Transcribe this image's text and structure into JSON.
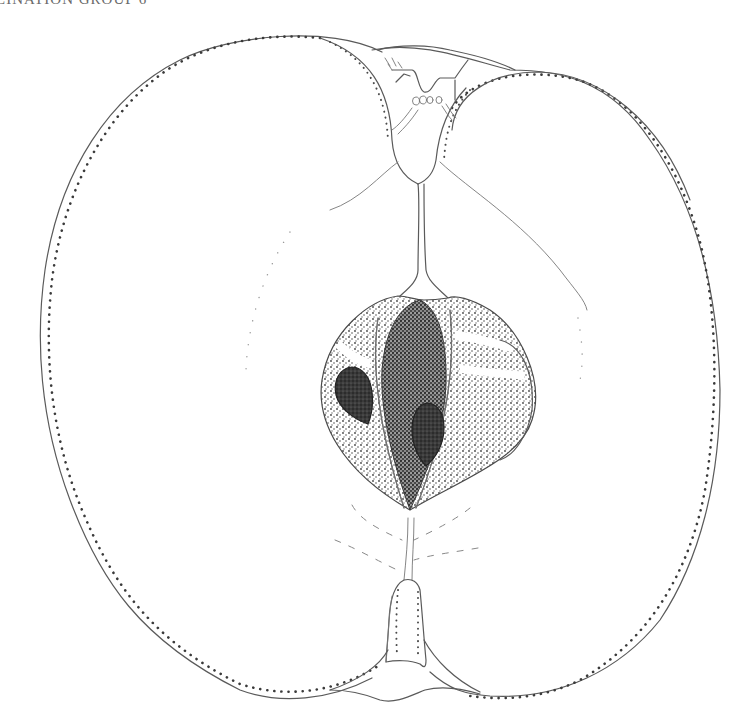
{
  "header": {
    "caption": "LINATION GROUP 6"
  },
  "illustration": {
    "subject": "apple-longitudinal-section",
    "style": "pen-and-ink stipple drawing",
    "colors": {
      "background": "#ffffff",
      "line": "#5a5a5a",
      "stipple": "#3a3a3a",
      "seed": "#2e2e2e"
    },
    "parts": [
      "skin-outline",
      "stalk-cavity",
      "core-tube",
      "core-locules",
      "seeds",
      "calyx-eye",
      "vascular-bundles"
    ]
  }
}
